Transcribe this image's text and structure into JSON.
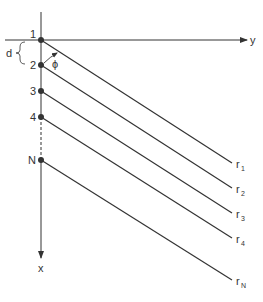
{
  "diagram": {
    "axes": {
      "horizontal_label": "y",
      "vertical_label": "x"
    },
    "spacing_label": "d",
    "angle_label": "ϕ",
    "points": [
      {
        "label": "1",
        "ray": "r",
        "ray_sub": "1"
      },
      {
        "label": "2",
        "ray": "r",
        "ray_sub": "2"
      },
      {
        "label": "3",
        "ray": "r",
        "ray_sub": "3"
      },
      {
        "label": "4",
        "ray": "r",
        "ray_sub": "4"
      },
      {
        "label": "N",
        "ray": "r",
        "ray_sub": "N"
      }
    ],
    "colors": {
      "line": "#333333",
      "background": "#ffffff"
    }
  }
}
